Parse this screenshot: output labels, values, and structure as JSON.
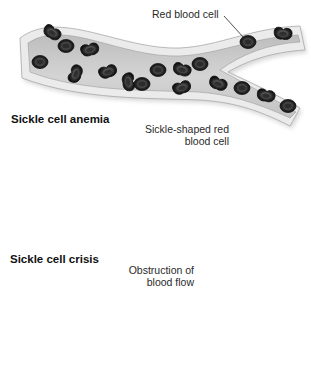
{
  "figure": {
    "panels": [
      {
        "id": "normal",
        "title": "",
        "label_lines": [
          "Red blood cell"
        ],
        "cell_shape": "biconcave disc"
      },
      {
        "id": "sickle-cell-anemia",
        "title": "Sickle cell anemia",
        "label_lines": [
          "Sickle-shaped red",
          "blood cell"
        ],
        "cell_shape": "sickle / crescent mixed with normal discs"
      },
      {
        "id": "sickle-cell-crisis",
        "title": "Sickle cell crisis",
        "label_lines": [
          "Obstruction of",
          "blood flow"
        ],
        "cell_shape": "sickle cells clumped at branch point"
      }
    ]
  },
  "colors": {
    "background": "#ffffff",
    "vessel_lumen": "#cfcfcf",
    "vessel_wall": "#e9e9e9",
    "vessel_edge": "#9a9a9a",
    "cell_fill": "#2b2b2b",
    "cell_center": "#4a4a4a",
    "text": "#2a2a2a"
  }
}
